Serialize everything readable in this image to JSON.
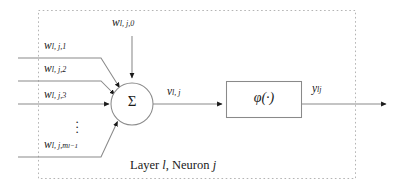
{
  "figure": {
    "kind": "artificial-neuron-schematic",
    "caption_prefix": "Layer ",
    "caption_layer_symbol": "l",
    "caption_middle": ", Neuron ",
    "caption_neuron_symbol": "j",
    "boundary_style": "dotted",
    "colors": {
      "stroke": "#808080",
      "text": "#1a1a1a",
      "arrowhead": "#1a1a1a",
      "boundary": "#b0b0b0",
      "background": "#ffffff"
    }
  },
  "nodes": {
    "summation": {
      "symbol": "Σ",
      "shape": "circle",
      "center_x": 132,
      "center_y": 104,
      "radius": 21
    },
    "activation": {
      "symbol": "φ(·)",
      "shape": "rectangle",
      "x": 226,
      "y": 81,
      "width": 76,
      "height": 36
    }
  },
  "labels": {
    "bias_weight": {
      "base": "w",
      "sub": "l, j,",
      "sub_index": "0"
    },
    "input_weights": [
      {
        "base": "w",
        "sub": "l, j,",
        "sub_index": "1"
      },
      {
        "base": "w",
        "sub": "l, j,",
        "sub_index": "2"
      },
      {
        "base": "w",
        "sub": "l, j,",
        "sub_index": "3"
      },
      {
        "base": "w",
        "sub": "l, j,",
        "sub_index": "m",
        "sub_sub": "l−1"
      }
    ],
    "net_input": {
      "base": "v",
      "sub": "l, j"
    },
    "output": {
      "base": "y",
      "sub": "lj"
    },
    "ellipsis": "⋮"
  }
}
